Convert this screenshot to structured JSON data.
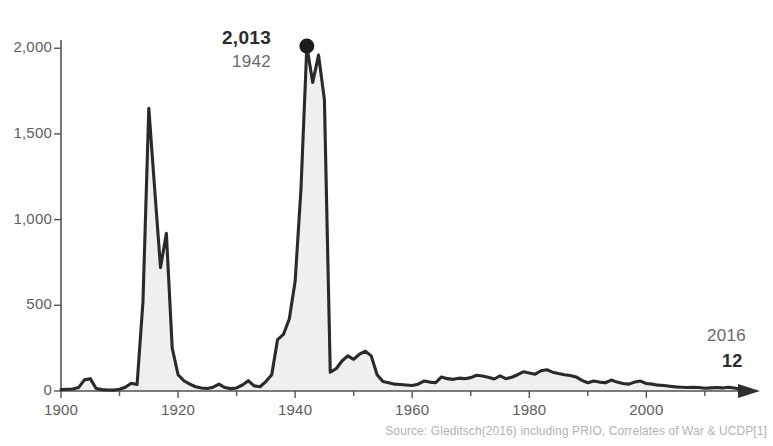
{
  "title_fragment": "",
  "source_note": "Source: Gleditsch(2016) including PRIO, Correlates of War & UCDP[1]",
  "annotations": {
    "peak_value": "2,013",
    "peak_year": "1942",
    "end_year": "2016",
    "end_value": "12"
  },
  "axis": {
    "y_ticks": [
      "0",
      "500",
      "1,000",
      "1,500",
      "2,000"
    ],
    "x_ticks": [
      "1900",
      "1920",
      "1940",
      "1960",
      "1980",
      "2000"
    ]
  },
  "colors": {
    "line": "#2a2a2a",
    "fill": "#efefef",
    "fill_stroke": "#dcdcdc",
    "axis": "#555555",
    "tick_text": "#5e5e5e",
    "source_text": "#b2b2b6",
    "marker": "#1c1c1c"
  },
  "chart_data": {
    "type": "area",
    "title": "",
    "xlabel": "",
    "ylabel": "",
    "xlim": [
      1900,
      2016
    ],
    "ylim": [
      0,
      2100
    ],
    "grid": false,
    "legend": null,
    "y_ticks": [
      0,
      500,
      1000,
      1500,
      2000
    ],
    "x_ticks": [
      1900,
      1920,
      1940,
      1960,
      1980,
      2000
    ],
    "annotations": [
      {
        "label": "2,013",
        "sublabel": "1942",
        "x": 1942,
        "y": 2013,
        "marker": "dot"
      },
      {
        "label": "12",
        "sublabel": "2016",
        "x": 2016,
        "y": 12,
        "marker": "arrow"
      }
    ],
    "series": [
      {
        "name": "Battle deaths per 100,000 (global)",
        "x": [
          1900,
          1901,
          1902,
          1903,
          1904,
          1905,
          1906,
          1907,
          1908,
          1909,
          1910,
          1911,
          1912,
          1913,
          1914,
          1915,
          1916,
          1917,
          1918,
          1919,
          1920,
          1921,
          1922,
          1923,
          1924,
          1925,
          1926,
          1927,
          1928,
          1929,
          1930,
          1931,
          1932,
          1933,
          1934,
          1935,
          1936,
          1937,
          1938,
          1939,
          1940,
          1941,
          1942,
          1943,
          1944,
          1945,
          1946,
          1947,
          1948,
          1949,
          1950,
          1951,
          1952,
          1953,
          1954,
          1955,
          1956,
          1957,
          1958,
          1959,
          1960,
          1961,
          1962,
          1963,
          1964,
          1965,
          1966,
          1967,
          1968,
          1969,
          1970,
          1971,
          1972,
          1973,
          1974,
          1975,
          1976,
          1977,
          1978,
          1979,
          1980,
          1981,
          1982,
          1983,
          1984,
          1985,
          1986,
          1987,
          1988,
          1989,
          1990,
          1991,
          1992,
          1993,
          1994,
          1995,
          1996,
          1997,
          1998,
          1999,
          2000,
          2001,
          2002,
          2003,
          2004,
          2005,
          2006,
          2007,
          2008,
          2009,
          2010,
          2011,
          2012,
          2013,
          2014,
          2015,
          2016
        ],
        "values": [
          8,
          10,
          12,
          20,
          65,
          72,
          15,
          8,
          6,
          5,
          10,
          22,
          45,
          38,
          520,
          1650,
          1180,
          720,
          920,
          250,
          95,
          60,
          40,
          25,
          18,
          15,
          22,
          40,
          20,
          14,
          18,
          35,
          60,
          30,
          25,
          55,
          95,
          300,
          330,
          420,
          640,
          1180,
          2013,
          1800,
          1960,
          1700,
          110,
          130,
          175,
          205,
          185,
          215,
          232,
          205,
          95,
          55,
          48,
          40,
          38,
          35,
          32,
          40,
          58,
          52,
          48,
          82,
          72,
          68,
          75,
          72,
          78,
          92,
          88,
          80,
          70,
          88,
          72,
          80,
          95,
          112,
          105,
          98,
          118,
          124,
          110,
          102,
          95,
          90,
          82,
          62,
          48,
          58,
          52,
          48,
          64,
          52,
          44,
          40,
          52,
          58,
          44,
          40,
          34,
          32,
          28,
          24,
          22,
          20,
          22,
          20,
          16,
          18,
          20,
          18,
          22,
          18,
          12
        ]
      }
    ]
  }
}
